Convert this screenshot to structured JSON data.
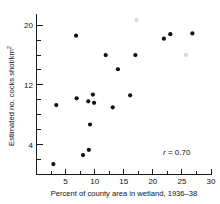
{
  "chart_data": {
    "type": "scatter",
    "title": "",
    "xlabel": "Percent of county area in wetland, 1936–38",
    "ylabel": "Estimated no. cocks shot/km",
    "ylabel_superscript": "2",
    "xlim": [
      0,
      30
    ],
    "ylim": [
      0,
      21.5
    ],
    "x_ticks": [
      5,
      10,
      15,
      20,
      25,
      30
    ],
    "x_tick_labels": [
      "5",
      "10",
      "15",
      "20",
      "25",
      "30"
    ],
    "x_minor_ticks": [
      2.5,
      7.5,
      12.5,
      17.5,
      22.5,
      27.5
    ],
    "y_ticks": [
      4,
      12,
      20
    ],
    "y_tick_labels": [
      "4",
      "12",
      "20"
    ],
    "y_minor_ticks": [
      2,
      6,
      8,
      10,
      14,
      16,
      18
    ],
    "grid": false,
    "legend": false,
    "annotation": {
      "symbol": "r",
      "text": " = 0.70",
      "value": 0.7,
      "x": 23.0,
      "y": 2.2
    },
    "marker": {
      "shape": "circle",
      "size": 2.1,
      "color": "#111111",
      "faint_color": "#d8d8d8"
    },
    "points": [
      {
        "x": 2.9,
        "y": 1.4,
        "faint": false
      },
      {
        "x": 3.4,
        "y": 9.3,
        "faint": false
      },
      {
        "x": 6.8,
        "y": 18.6,
        "faint": false
      },
      {
        "x": 6.9,
        "y": 10.2,
        "faint": false
      },
      {
        "x": 8.0,
        "y": 2.6,
        "faint": false
      },
      {
        "x": 8.9,
        "y": 9.8,
        "faint": false
      },
      {
        "x": 9.0,
        "y": 3.3,
        "faint": false
      },
      {
        "x": 9.2,
        "y": 6.7,
        "faint": false
      },
      {
        "x": 9.7,
        "y": 10.7,
        "faint": false
      },
      {
        "x": 9.9,
        "y": 9.6,
        "faint": false
      },
      {
        "x": 11.9,
        "y": 16.0,
        "faint": false
      },
      {
        "x": 13.1,
        "y": 9.0,
        "faint": false
      },
      {
        "x": 14.0,
        "y": 14.1,
        "faint": false
      },
      {
        "x": 16.1,
        "y": 10.6,
        "faint": false
      },
      {
        "x": 17.0,
        "y": 16.0,
        "faint": false
      },
      {
        "x": 17.2,
        "y": 20.7,
        "faint": true
      },
      {
        "x": 21.9,
        "y": 18.2,
        "faint": false
      },
      {
        "x": 23.0,
        "y": 18.8,
        "faint": false
      },
      {
        "x": 25.7,
        "y": 16.0,
        "faint": true
      },
      {
        "x": 26.8,
        "y": 18.9,
        "faint": false
      }
    ]
  }
}
